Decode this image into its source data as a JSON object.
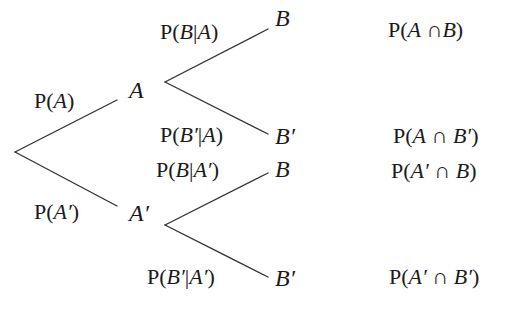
{
  "diagram": {
    "type": "probability-tree",
    "root": {
      "branches": [
        {
          "label": "P(A)",
          "node": "A"
        },
        {
          "label": "P(A′)",
          "node": "A′"
        }
      ]
    },
    "nodes": {
      "A": {
        "label": "A",
        "branches": [
          {
            "label": "P(B|A)",
            "node": "B",
            "outcome": "P(A∩B)"
          },
          {
            "label": "P(B′|A)",
            "node": "B′",
            "outcome": "P(A∩B′)"
          }
        ]
      },
      "A_prime": {
        "label": "A′",
        "branches": [
          {
            "label": "P(B|A′)",
            "node": "B",
            "outcome": "P(A′∩B)"
          },
          {
            "label": "P(B′|A′)",
            "node": "B′",
            "outcome": "P(A′∩B′)"
          }
        ]
      }
    }
  },
  "text": {
    "p_a": {
      "p": "P(",
      "v": "A",
      "c": ")"
    },
    "p_a_prime": {
      "p": "P(",
      "v": "A′",
      "c": ")"
    },
    "node_a": "A",
    "node_a_prime": "A′",
    "p_b_given_a": {
      "p": "P(",
      "v1": "B",
      "bar": "|",
      "v2": "A",
      "c": ")"
    },
    "p_bp_given_a": {
      "p": "P(",
      "v1": "B′",
      "bar": "|",
      "v2": "A",
      "c": ")"
    },
    "p_b_given_ap": {
      "p": "P(",
      "v1": "B",
      "bar": "|",
      "v2": "A′",
      "c": ")"
    },
    "p_bp_given_ap": {
      "p": "P(",
      "v1": "B′",
      "bar": "|",
      "v2": "A′",
      "c": ")"
    },
    "node_b_1": "B",
    "node_bp_1": "B′",
    "node_b_2": "B",
    "node_bp_2": "B′",
    "out_1": {
      "p": "P(",
      "v1": "A",
      "cap": " ∩",
      "v2": "B",
      "c": ")"
    },
    "out_2": {
      "p": "P(",
      "v1": "A",
      "cap": " ∩ ",
      "v2": "B′",
      "c": ")"
    },
    "out_3": {
      "p": "P(",
      "v1": "A′",
      "cap": " ∩ ",
      "v2": "B",
      "c": ")"
    },
    "out_4": {
      "p": "P(",
      "v1": "A′",
      "cap": " ∩ ",
      "v2": "B′",
      "c": ")"
    }
  }
}
